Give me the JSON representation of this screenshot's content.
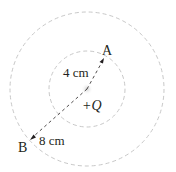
{
  "diagram": {
    "charge_label": "+Q",
    "point_a_label": "A",
    "point_b_label": "B",
    "inner_distance_label": "4 cm",
    "outer_distance_label": "8 cm",
    "colors": {
      "circle": "#c8c8c8",
      "line": "#231f20",
      "text": "#231f20"
    },
    "inner_radius_cm": 4,
    "outer_radius_cm": 8
  }
}
